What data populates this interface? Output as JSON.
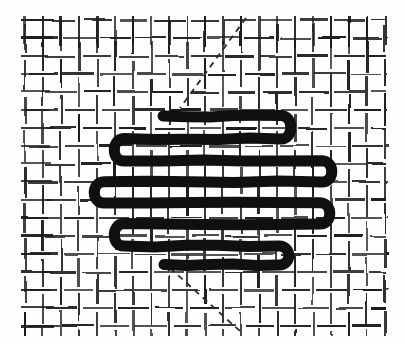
{
  "figure": {
    "title": "Woven dash texture with bold serpentine overlay",
    "width": 406,
    "height": 345,
    "background_color": "#fefefe",
    "ink_color": "#1c1c1c",
    "scribble_color": "#111111",
    "lead_color": "#2a2a2a"
  },
  "weave": {
    "description": "Basket-weave texture of short horizontal and vertical dashes",
    "region": {
      "x": 25,
      "y": 20,
      "width": 357,
      "height": 312
    },
    "cell_size": 36,
    "half_cell": 18,
    "dash_length": 30,
    "dash_thickness": 2.2,
    "columns": 10,
    "rows": 9,
    "pattern_type": "basket-weave",
    "stagger": "alternating-offset"
  },
  "scribble": {
    "description": "Bold back-and-forth serpentine (boustrophedon) fill stroke",
    "stroke_width": 11,
    "stroke_count": 8,
    "turn_style": "rounded-u-turn",
    "strokes": [
      {
        "index": 1,
        "y": 116,
        "x_start": 163,
        "x_end": 281,
        "direction": "right"
      },
      {
        "index": 2,
        "y": 139,
        "x_start": 281,
        "x_end": 124,
        "direction": "left"
      },
      {
        "index": 3,
        "y": 161,
        "x_start": 124,
        "x_end": 322,
        "direction": "right"
      },
      {
        "index": 4,
        "y": 182,
        "x_start": 322,
        "x_end": 104,
        "direction": "left"
      },
      {
        "index": 5,
        "y": 203,
        "x_start": 104,
        "x_end": 320,
        "direction": "right"
      },
      {
        "index": 6,
        "y": 224,
        "x_start": 320,
        "x_end": 124,
        "direction": "left"
      },
      {
        "index": 7,
        "y": 246,
        "x_start": 124,
        "x_end": 279,
        "direction": "right"
      },
      {
        "index": 8,
        "y": 265,
        "x_start": 279,
        "x_end": 164,
        "direction": "left"
      }
    ]
  },
  "leads": [
    {
      "name": "entry-lead-line",
      "description": "Dashed diagonal entering from upper right down to scribble start",
      "x1": 246,
      "y1": 18,
      "x2": 180,
      "y2": 108,
      "dash_pattern": "6 5",
      "stroke_width": 1.8
    },
    {
      "name": "exit-lead-line",
      "description": "Dashed diagonal leaving below the scribble toward lower right",
      "x1": 170,
      "y1": 268,
      "x2": 241,
      "y2": 332,
      "dash_pattern": "6 5",
      "stroke_width": 1.8
    }
  ]
}
